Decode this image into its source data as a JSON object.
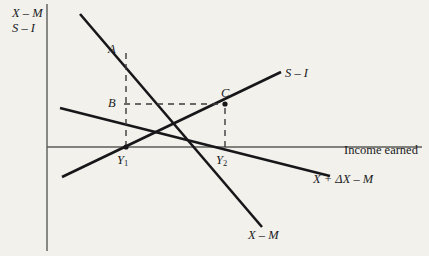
{
  "figure": {
    "type": "economics-line-diagram",
    "background_color": "#f2f1ec",
    "curve_color": "#17171a",
    "axis_color": "#5b5b58"
  },
  "axes": {
    "y_axis_label_line1": "X – M",
    "y_axis_label_line2": "S – I",
    "x_axis_label": "Income earned",
    "y_axis_x_px": 47,
    "x_axis_y_px": 147
  },
  "curves": [
    {
      "id": "x-minus-m",
      "label": "X – M",
      "description": "downward sloping net exports schedule",
      "from": [
        80,
        14
      ],
      "to": [
        262,
        227
      ],
      "crosses_x_axis_at": "Y1"
    },
    {
      "id": "x-plus-delta-x-minus-m",
      "label": "X + ΔX – M",
      "description": "shifted net exports schedule, downward sloping",
      "from": [
        60,
        108
      ],
      "to": [
        330,
        176
      ],
      "crosses_x_axis_at": 297
    },
    {
      "id": "s-minus-i",
      "label": "S – I",
      "description": "upward sloping saving minus investment schedule",
      "from": [
        62,
        177
      ],
      "to": [
        281,
        72
      ],
      "crosses_x_axis_at": "Y1"
    }
  ],
  "points": [
    {
      "id": "A",
      "label": "A",
      "x_px": 126,
      "y_px": 50,
      "note": "on X – M above Y1"
    },
    {
      "id": "B",
      "label": "B",
      "x_px": 126,
      "y_px": 104,
      "note": "on vertical at Y1, level with C"
    },
    {
      "id": "C",
      "label": "C",
      "x_px": 225,
      "y_px": 104,
      "note": "intersection of S – I and X + ΔX – M"
    },
    {
      "id": "Y1",
      "label": "Y",
      "subscript": "1",
      "x_px": 126,
      "y_px": 147,
      "note": "initial equilibrium income"
    },
    {
      "id": "Y2",
      "label": "Y",
      "subscript": "2",
      "x_px": 225,
      "y_px": 147,
      "note": "new equilibrium income"
    }
  ],
  "guides": [
    {
      "id": "vertical-y1",
      "description": "dashed vertical from Y1 up to A",
      "points": [
        [
          126,
          147
        ],
        [
          126,
          48
        ]
      ]
    },
    {
      "id": "horizontal-bc",
      "description": "dashed horizontal from B to C",
      "points": [
        [
          124,
          104
        ],
        [
          225,
          104
        ]
      ]
    },
    {
      "id": "vertical-y2",
      "description": "dashed vertical from Y2 up to C",
      "points": [
        [
          225,
          147
        ],
        [
          225,
          104
        ]
      ]
    }
  ]
}
